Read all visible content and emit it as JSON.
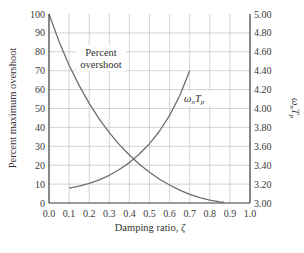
{
  "chart_data": {
    "type": "line",
    "title": "",
    "xlabel": "Damping ratio, ζ",
    "ylabel": "Percent maximum overshoot",
    "y2label": "ωnTp",
    "xlim": [
      0.0,
      1.0
    ],
    "ylim": [
      0,
      100
    ],
    "y2lim": [
      3.0,
      5.0
    ],
    "grid": true,
    "legend": "none (curves annotated inline)",
    "x_ticks": [
      "0.0",
      "0.1",
      "0.2",
      "0.3",
      "0.4",
      "0.5",
      "0.6",
      "0.7",
      "0.8",
      "0.9",
      "1.0"
    ],
    "y_ticks": [
      "0",
      "10",
      "20",
      "30",
      "40",
      "50",
      "60",
      "70",
      "80",
      "90",
      "100"
    ],
    "y2_ticks": [
      "3.00",
      "3.20",
      "3.40",
      "3.60",
      "3.80",
      "4.00",
      "4.20",
      "4.40",
      "4.60",
      "4.80",
      "5.00"
    ],
    "series": [
      {
        "name": "Percent overshoot",
        "axis": "left",
        "annotation": [
          "Percent",
          "overshoot"
        ],
        "x": [
          0.0,
          0.05,
          0.1,
          0.15,
          0.2,
          0.25,
          0.3,
          0.35,
          0.4,
          0.45,
          0.5,
          0.55,
          0.6,
          0.65,
          0.7,
          0.75,
          0.8,
          0.85,
          0.87
        ],
        "values": [
          100.0,
          85.5,
          72.9,
          62.1,
          52.7,
          44.4,
          37.2,
          30.9,
          25.4,
          20.5,
          16.3,
          12.6,
          9.5,
          6.8,
          4.6,
          2.8,
          1.5,
          0.6,
          0.4
        ]
      },
      {
        "name": "ωnTp",
        "axis": "right",
        "annotation": "ωnTp",
        "x": [
          0.1,
          0.15,
          0.2,
          0.25,
          0.3,
          0.35,
          0.4,
          0.45,
          0.5,
          0.55,
          0.6,
          0.65,
          0.7
        ],
        "values": [
          3.157,
          3.178,
          3.207,
          3.245,
          3.293,
          3.354,
          3.428,
          3.518,
          3.628,
          3.762,
          3.927,
          4.134,
          4.399
        ]
      }
    ]
  },
  "labels": {
    "xlabel_text": "Damping ratio, ",
    "xlabel_symbol": "ζ",
    "ylabel": "Percent maximum overshoot",
    "y2label_omega": "ω",
    "y2label_n": "n",
    "y2label_T": "T",
    "y2label_p": "p",
    "pos_line1": "Percent",
    "pos_line2": "overshoot",
    "wt_omega": "ω",
    "wt_n": "n",
    "wt_T": "T",
    "wt_p": "p"
  },
  "colors": {
    "curve": "#6e6e6e",
    "grid": "#c8c8c8",
    "axis": "#3a3a3a",
    "text": "#333333"
  }
}
